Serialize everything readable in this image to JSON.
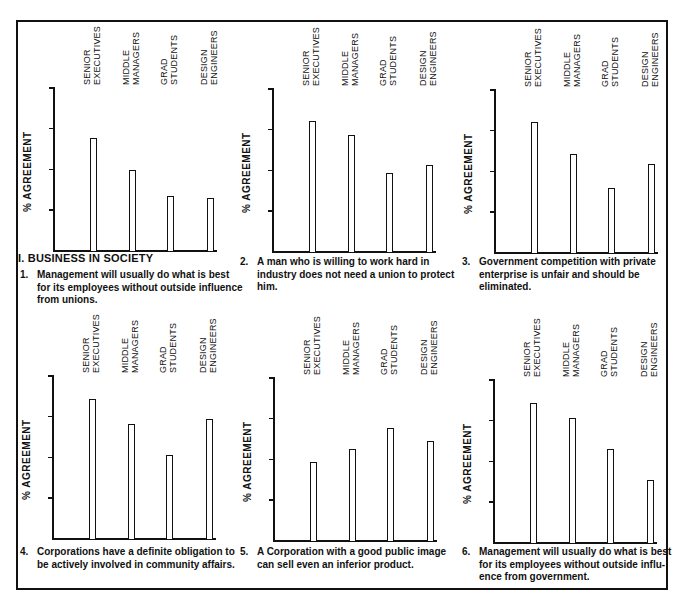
{
  "section_title": "I. BUSINESS IN SOCIETY",
  "y_axis_label": "% AGREEMENT",
  "y_ticks": [
    "100",
    "75",
    "50",
    "25"
  ],
  "categories": [
    [
      "SENIOR",
      "EXECUTIVES"
    ],
    [
      "MIDDLE",
      "MANAGERS"
    ],
    [
      "GRAD",
      "STUDENTS"
    ],
    [
      "DESIGN",
      "ENGINEERS"
    ]
  ],
  "chart_data": [
    {
      "type": "bar",
      "number": "1.",
      "title": "Management will usually do what is best for its employees without outside influence from unions.",
      "categories": [
        "SENIOR EXECUTIVES",
        "MIDDLE MANAGERS",
        "GRAD STUDENTS",
        "DESIGN ENGINEERS"
      ],
      "values": [
        69,
        49,
        33,
        32
      ],
      "xlabel": "",
      "ylabel": "% AGREEMENT",
      "ylim": [
        0,
        100
      ],
      "yticks": [
        25,
        50,
        75,
        100
      ],
      "grid": false,
      "legend": null
    },
    {
      "type": "bar",
      "number": "2.",
      "title": "A man who is willing to work hard in industry does not need a union to protect him.",
      "categories": [
        "SENIOR EXECUTIVES",
        "MIDDLE MANAGERS",
        "GRAD STUDENTS",
        "DESIGN ENGINEERS"
      ],
      "values": [
        80,
        71,
        48,
        53
      ],
      "xlabel": "",
      "ylabel": "% AGREEMENT",
      "ylim": [
        0,
        100
      ],
      "yticks": [
        25,
        50,
        75,
        100
      ],
      "grid": false,
      "legend": null
    },
    {
      "type": "bar",
      "number": "3.",
      "title": "Government competition with private enterprise is unfair and should be eliminated.",
      "categories": [
        "SENIOR EXECUTIVES",
        "MIDDLE MANAGERS",
        "GRAD STUDENTS",
        "DESIGN ENGINEERS"
      ],
      "values": [
        80,
        60,
        39,
        54
      ],
      "xlabel": "",
      "ylabel": "% AGREEMENT",
      "ylim": [
        0,
        100
      ],
      "yticks": [
        25,
        50,
        75,
        100
      ],
      "grid": false,
      "legend": null
    },
    {
      "type": "bar",
      "number": "4.",
      "title": "Corporations have a definite obligation to be actively involved in community affairs.",
      "categories": [
        "SENIOR EXECUTIVES",
        "MIDDLE MANAGERS",
        "GRAD STUDENTS",
        "DESIGN ENGINEERS"
      ],
      "values": [
        85,
        70,
        51,
        73
      ],
      "xlabel": "",
      "ylabel": "% AGREEMENT",
      "ylim": [
        0,
        100
      ],
      "yticks": [
        25,
        50,
        75,
        100
      ],
      "grid": false,
      "legend": null
    },
    {
      "type": "bar",
      "number": "5.",
      "title": "A Corporation with a good public image can sell even an inferior product.",
      "categories": [
        "SENIOR EXECUTIVES",
        "MIDDLE MANAGERS",
        "GRAD STUDENTS",
        "DESIGN ENGINEERS"
      ],
      "values": [
        48,
        56,
        69,
        61
      ],
      "xlabel": "",
      "ylabel": "% AGREEMENT",
      "ylim": [
        0,
        100
      ],
      "yticks": [
        25,
        50,
        75,
        100
      ],
      "grid": false,
      "legend": null
    },
    {
      "type": "bar",
      "number": "6.",
      "title": "Management will usually do what is best for its employees without outside influ-ence from government.",
      "categories": [
        "SENIOR EXECUTIVES",
        "MIDDLE MANAGERS",
        "GRAD STUDENTS",
        "DESIGN ENGINEERS"
      ],
      "values": [
        85,
        76,
        57,
        38
      ],
      "xlabel": "",
      "ylabel": "% AGREEMENT",
      "ylim": [
        0,
        100
      ],
      "yticks": [
        25,
        50,
        75,
        100
      ],
      "grid": false,
      "legend": null
    }
  ],
  "captions": [
    {
      "number": "1.",
      "lines": [
        "Management will usually do what is best",
        "for its employees without outside influence",
        "from unions."
      ]
    },
    {
      "number": "2.",
      "lines": [
        "A man who is willing to work hard in",
        "industry does not need a union to protect",
        "him."
      ]
    },
    {
      "number": "3.",
      "lines": [
        "Government competition with private",
        "enterprise is unfair and should be",
        "eliminated."
      ]
    },
    {
      "number": "4.",
      "lines": [
        "Corporations have a definite obligation to",
        "be actively involved in community affairs."
      ]
    },
    {
      "number": "5.",
      "lines": [
        "A Corporation with a good public image",
        "can sell even an inferior product."
      ]
    },
    {
      "number": "6.",
      "lines": [
        "Management will usually do what is best",
        "for its employees without outside influ-",
        "ence from government."
      ]
    }
  ]
}
